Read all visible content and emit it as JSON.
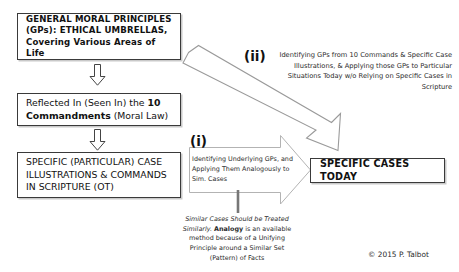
{
  "diagram": {
    "title_boxes": {
      "general_principles": "GENERAL MORAL PRINCIPLES (GPs): ETHICAL UMBRELLAS, Covering Various Areas of Life",
      "commandments_prefix": "Reflected In (Seen In) the ",
      "commandments_bold": "10 Commandments",
      "commandments_suffix": " (Moral Law)",
      "specific_scripture": "SPECIFIC (PARTICULAR) CASE ILLUSTRATIONS & COMMANDS IN SCRIPTURE (OT)",
      "specific_cases_today": "SPECIFIC CASES TODAY"
    },
    "paths": {
      "label_i": "(i)",
      "label_ii": "(ii)",
      "text_i": "Identifying Underlying GPs, and Applying Them Analogously to Sim. Cases",
      "text_ii": "Identifying GPs from 10 Commands & Specific Case Illustrations, & Applying those GPs to Particular Situations Today w/o Relying on Specific Cases in Scripture"
    },
    "note": {
      "part1": "Similar Cases Should be Treated Similarly. ",
      "bold": "Analogy",
      "part2": " is an available method because of a Unifying Principle around a Similar Set (Pattern) of Facts"
    },
    "copyright": "© 2015 P. Talbot",
    "colors": {
      "box_border": "#3a3a3a",
      "box_shadow": "#c9c9c9",
      "arrow_stroke": "#9a9a9a",
      "text": "#111111",
      "muted_text": "#2b2b2b",
      "background": "#ffffff"
    },
    "icons": {
      "down_arrow": "down-block-arrow",
      "right_arrow": "right-block-arrow",
      "diagonal_arrow": "diagonal-block-arrow"
    }
  }
}
